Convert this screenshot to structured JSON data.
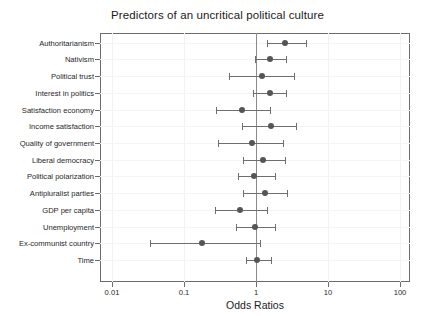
{
  "chart_data": {
    "type": "scatter",
    "subtype": "forest-plot",
    "title": "Predictors of an uncritical political culture",
    "xlabel": "Odds Ratios",
    "ylabel": "",
    "xscale": "log10",
    "xlim": [
      0.0057,
      160
    ],
    "xticks": [
      0.01,
      0.1,
      1,
      10,
      100
    ],
    "xticklabels": [
      "0.01",
      "0.1",
      "1",
      "10",
      "100"
    ],
    "reference_line": 1,
    "grid": "light",
    "legend": "none",
    "marker_color": "#555555",
    "line_color": "#6e6e6e",
    "categories": [
      "Authoritarianism",
      "Nativism",
      "Political trust",
      "Interest in politics",
      "Satisfaction economy",
      "Income satisfaction",
      "Quality of government",
      "Liberal democracy",
      "Political polarization",
      "Antipluralist parties",
      "GDP per capita",
      "Unemployment",
      "Ex-communist country",
      "Time"
    ],
    "points": [
      {
        "label": "Authoritarianism",
        "odds_ratio": 2.53,
        "ci_low": 1.42,
        "ci_high": 4.95
      },
      {
        "label": "Nativism",
        "odds_ratio": 1.57,
        "ci_low": 0.98,
        "ci_high": 2.62
      },
      {
        "label": "Political trust",
        "odds_ratio": 1.2,
        "ci_low": 0.42,
        "ci_high": 3.38
      },
      {
        "label": "Interest in politics",
        "odds_ratio": 1.55,
        "ci_low": 0.92,
        "ci_high": 2.6
      },
      {
        "label": "Satisfaction economy",
        "odds_ratio": 0.64,
        "ci_low": 0.28,
        "ci_high": 1.57
      },
      {
        "label": "Income satisfaction",
        "odds_ratio": 1.62,
        "ci_low": 0.64,
        "ci_high": 3.6
      },
      {
        "label": "Quality of government",
        "odds_ratio": 0.87,
        "ci_low": 0.3,
        "ci_high": 2.4
      },
      {
        "label": "Liberal democracy",
        "odds_ratio": 1.27,
        "ci_low": 0.65,
        "ci_high": 2.55
      },
      {
        "label": "Political polarization",
        "odds_ratio": 0.94,
        "ci_low": 0.56,
        "ci_high": 1.82
      },
      {
        "label": "Antipluralist parties",
        "odds_ratio": 1.33,
        "ci_low": 0.66,
        "ci_high": 2.73
      },
      {
        "label": "GDP per capita",
        "odds_ratio": 0.6,
        "ci_low": 0.27,
        "ci_high": 1.4
      },
      {
        "label": "Unemployment",
        "odds_ratio": 0.98,
        "ci_low": 0.52,
        "ci_high": 1.84
      },
      {
        "label": "Ex-communist country",
        "odds_ratio": 0.18,
        "ci_low": 0.034,
        "ci_high": 1.12
      },
      {
        "label": "Time",
        "odds_ratio": 1.02,
        "ci_low": 0.72,
        "ci_high": 1.62
      }
    ]
  }
}
